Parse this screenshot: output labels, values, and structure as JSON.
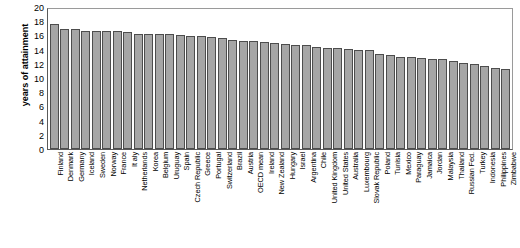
{
  "chart_data": {
    "type": "bar",
    "title": "",
    "xlabel": "",
    "ylabel": "years of attainment",
    "ylim": [
      0,
      20
    ],
    "yticks": [
      20,
      18,
      16,
      14,
      12,
      10,
      8,
      6,
      4,
      2,
      0
    ],
    "ytick_labels": [
      "20",
      "18",
      "16",
      "14",
      "12",
      "10",
      "8",
      "6",
      "4",
      "2",
      "0"
    ],
    "grid": false,
    "legend": null,
    "highlight_category": "United States",
    "colors": {
      "bar_fill": "#a6a6a6",
      "bar_edge": "#4d4d4d",
      "highlight_fill": "#3b3b3b",
      "highlight_edge": "#1c1c1c",
      "axis": "#5a5a5a",
      "text": "#000000",
      "background": "#ffffff"
    },
    "categories": [
      "Finland",
      "Denmark",
      "Germany",
      "Iceland",
      "Sweden",
      "Norway",
      "France",
      "It aly",
      "Netherlands",
      "Korea",
      "Belgium",
      "Uruguay",
      "Spain",
      "Czech Republic",
      "Greece",
      "Portugal",
      "Switzerland",
      "Brazil",
      "Austria",
      "OECD mean",
      "Ireland",
      "New Zealand",
      "Hungary",
      "Israel",
      "Argentina",
      "Chile",
      "United Kingdom",
      "United  States",
      "Australia",
      "Luxembourg",
      "Slovak Republic",
      "Poland",
      "Tunisia",
      "Mexico",
      "Paraguay",
      "Jamaica",
      "Jordan",
      "Malaysia",
      "Thailand",
      "Russian Fed.",
      "Turkey",
      "Indonesia",
      "Philippines",
      "Zimbabwe"
    ],
    "values": [
      17.9,
      17.2,
      17.1,
      16.9,
      16.9,
      16.8,
      16.8,
      16.7,
      16.5,
      16.4,
      16.4,
      16.4,
      16.3,
      16.2,
      16.1,
      16.0,
      15.9,
      15.6,
      15.5,
      15.4,
      15.3,
      15.2,
      15.0,
      14.9,
      14.8,
      14.6,
      14.5,
      14.4,
      14.3,
      14.2,
      14.1,
      13.6,
      13.4,
      13.2,
      13.1,
      13.0,
      12.9,
      12.8,
      12.6,
      12.3,
      12.2,
      11.9,
      11.6,
      11.5
    ]
  }
}
